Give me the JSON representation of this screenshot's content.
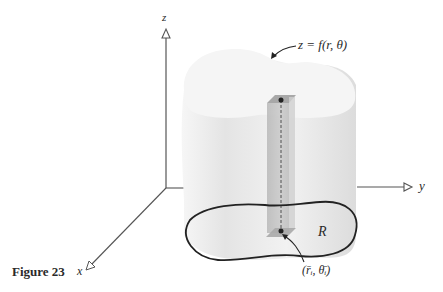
{
  "figure": {
    "caption": "Figure 23",
    "axes": {
      "x_label": "x",
      "y_label": "y",
      "z_label": "z"
    },
    "surface_label": "z = f(r, θ)",
    "region_label": "R",
    "sample_point_label": "(r̄ᵢ, θ̄ᵢ)",
    "colors": {
      "axis": "#555555",
      "solid_fill": "#efefef",
      "solid_top": "#f4f4f4",
      "column": "#bdbdbd",
      "region_outline": "#222222",
      "text": "#2a2a2a"
    }
  }
}
